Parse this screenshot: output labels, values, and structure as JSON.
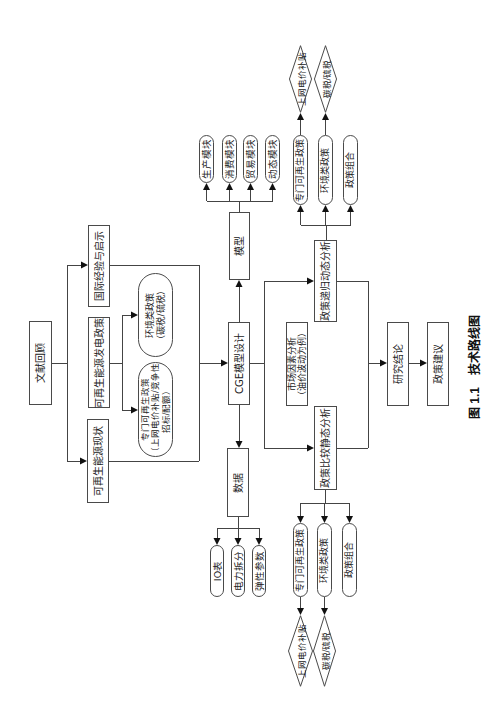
{
  "caption": {
    "number": "图 1.1",
    "title": "技术路线图"
  },
  "literature": {
    "root": "文献回顾",
    "status": "可再生能源现状",
    "power_policy": "可再生能源发电政策",
    "international": "国际经验与启示",
    "dedicated_policy": {
      "title": "专门可再生政策",
      "detail_1": "（上网电价补贴/竞争性",
      "detail_2": "招标/配额）"
    },
    "environmental_policy": {
      "title": "环境类政策",
      "detail": "（碳税/硫税）"
    }
  },
  "cge": {
    "design": "CGE模型设计",
    "model": {
      "label": "模型",
      "modules": [
        "生产模块",
        "消费模块",
        "贸易模块",
        "动态模块"
      ]
    },
    "data": {
      "label": "数据",
      "items": [
        "IO表",
        "电力拆分",
        "弹性参数"
      ]
    }
  },
  "analysis": {
    "static": {
      "label": "政策比较静态分析",
      "scenarios": [
        "专门可再生政策",
        "环境类政策",
        "政策组合"
      ],
      "instruments": [
        "上网电价补贴",
        "碳税/硫税"
      ]
    },
    "dynamic": {
      "label": "政策递归动态分析",
      "scenarios": [
        "专门可再生政策",
        "环境类政策",
        "政策组合"
      ],
      "instruments": [
        "上网电价补贴",
        "碳税/硫税"
      ]
    },
    "market": {
      "title": "市场因素分析",
      "detail": "（油价波动为例）"
    }
  },
  "outcome": {
    "conclusion": "研究结论",
    "recommendation": "政策建议"
  },
  "edges": [
    {
      "from": "文献回顾",
      "to": "可再生能源现状"
    },
    {
      "from": "文献回顾",
      "to": "国际经验与启示"
    },
    {
      "from": "可再生能源发电政策",
      "to": "专门可再生政策"
    },
    {
      "from": "可再生能源发电政策",
      "to": "环境类政策"
    },
    {
      "from": [
        "可再生能源现状",
        "国际经验与启示"
      ],
      "to": "CGE模型设计"
    },
    {
      "from": "CGE模型设计",
      "to": "模型"
    },
    {
      "from": "CGE模型设计",
      "to": "数据"
    },
    {
      "from": "模型",
      "to": [
        "生产模块",
        "消费模块",
        "贸易模块",
        "动态模块"
      ]
    },
    {
      "from": "数据",
      "to": [
        "IO表",
        "电力拆分",
        "弹性参数"
      ]
    },
    {
      "from": "CGE模型设计",
      "to": [
        "政策比较静态分析",
        "政策递归动态分析"
      ]
    },
    {
      "from": "政策比较静态分析",
      "to": [
        "专门可再生政策",
        "环境类政策",
        "政策组合"
      ]
    },
    {
      "from": "政策递归动态分析",
      "to": [
        "专门可再生政策",
        "环境类政策",
        "政策组合"
      ]
    },
    {
      "from": "专门可再生政策",
      "to": "上网电价补贴"
    },
    {
      "from": "环境类政策",
      "to": "碳税/硫税"
    },
    {
      "from": [
        "政策比较静态分析",
        "政策递归动态分析"
      ],
      "to": "研究结论"
    },
    {
      "from": "研究结论",
      "to": "政策建议"
    }
  ]
}
